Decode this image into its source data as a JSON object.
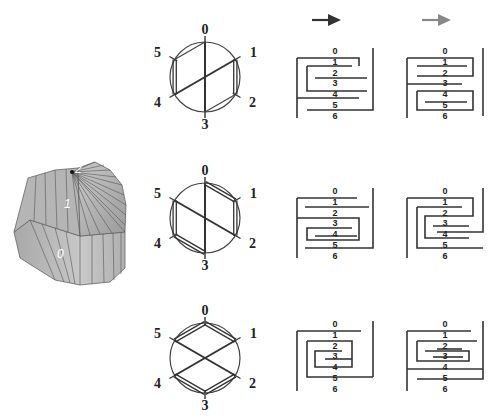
{
  "polyhedron": {
    "labels": [
      "0",
      "1",
      "2"
    ],
    "face_color": "#b8b8b8",
    "edge_color": "#555555"
  },
  "arrows": {
    "dark": {
      "color": "#333333"
    },
    "light": {
      "color": "#888888"
    }
  },
  "circle_diagrams": [
    {
      "vertex_labels": [
        "0",
        "1",
        "2",
        "3",
        "4",
        "5"
      ],
      "chords": [
        [
          0,
          3
        ],
        [
          1,
          4
        ]
      ],
      "double_edges": [
        [
          5,
          4
        ],
        [
          1,
          2
        ]
      ],
      "single_edges": [
        [
          0,
          5
        ],
        [
          2,
          3
        ]
      ]
    },
    {
      "vertex_labels": [
        "0",
        "1",
        "2",
        "3",
        "4",
        "5"
      ],
      "chords": [
        [
          0,
          3
        ],
        [
          5,
          2
        ]
      ],
      "double_edges": [
        [
          0,
          1
        ],
        [
          1,
          2
        ],
        [
          5,
          4
        ],
        [
          4,
          3
        ]
      ],
      "single_edges": []
    },
    {
      "vertex_labels": [
        "0",
        "1",
        "2",
        "3",
        "4",
        "5"
      ],
      "chords": [
        [
          5,
          2
        ],
        [
          1,
          4
        ]
      ],
      "double_edges": [
        [
          0,
          1
        ],
        [
          0,
          5
        ],
        [
          4,
          3
        ],
        [
          3,
          2
        ]
      ],
      "single_edges": []
    }
  ],
  "meander_labels": [
    "0",
    "1",
    "2",
    "3",
    "4",
    "5",
    "6"
  ],
  "meanders": [
    {
      "row": 0,
      "col": 0
    },
    {
      "row": 0,
      "col": 1
    },
    {
      "row": 1,
      "col": 0
    },
    {
      "row": 1,
      "col": 1
    },
    {
      "row": 2,
      "col": 0
    },
    {
      "row": 2,
      "col": 1
    }
  ]
}
